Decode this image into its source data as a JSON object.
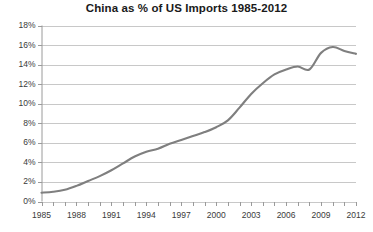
{
  "chart": {
    "title": "China as % of US Imports 1985-2012"
  },
  "axes": {
    "y_tick_labels": [
      "18%",
      "16%",
      "14%",
      "12%",
      "10%",
      "8%",
      "6%",
      "4%",
      "2%",
      "0%"
    ],
    "x_tick_labels": [
      "1985",
      "1988",
      "1991",
      "1994",
      "1997",
      "2000",
      "2003",
      "2006",
      "2009",
      "2012"
    ]
  },
  "colors": {
    "line": "#7f7f7f",
    "grid": "#c8c8c8",
    "axis": "#9a9a9a",
    "text": "#3a3a3a",
    "title": "#1a1a1a",
    "background": "#ffffff"
  },
  "chart_data": {
    "type": "line",
    "title": "China as % of US Imports 1985-2012",
    "xlabel": "",
    "ylabel": "",
    "xlim": [
      1985,
      2012
    ],
    "ylim": [
      0,
      18
    ],
    "ytick_step": 2,
    "grid": true,
    "legend": false,
    "x": [
      1985,
      1986,
      1987,
      1988,
      1989,
      1990,
      1991,
      1992,
      1993,
      1994,
      1995,
      1996,
      1997,
      1998,
      1999,
      2000,
      2001,
      2002,
      2003,
      2004,
      2005,
      2006,
      2007,
      2008,
      2009,
      2010,
      2011,
      2012
    ],
    "series": [
      {
        "name": "China as % of US Imports",
        "values": [
          0.9,
          1.0,
          1.2,
          1.6,
          2.1,
          2.6,
          3.2,
          3.9,
          4.6,
          5.1,
          5.4,
          5.9,
          6.3,
          6.7,
          7.1,
          7.6,
          8.3,
          9.6,
          11.0,
          12.1,
          13.0,
          13.5,
          13.8,
          13.5,
          15.2,
          15.8,
          15.4,
          15.1
        ]
      }
    ]
  }
}
